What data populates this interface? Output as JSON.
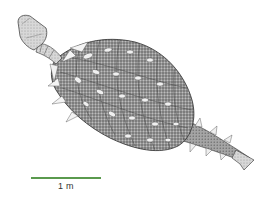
{
  "figure": {
    "colors": {
      "body_fill": "#8a8a8a",
      "body_dark": "#3c3c3c",
      "osteoderm": "#f2f2f2",
      "head": "#dcdcdc",
      "background": "#ffffff"
    }
  },
  "scale": {
    "label": "1 m",
    "color": "#5a9a4e"
  }
}
